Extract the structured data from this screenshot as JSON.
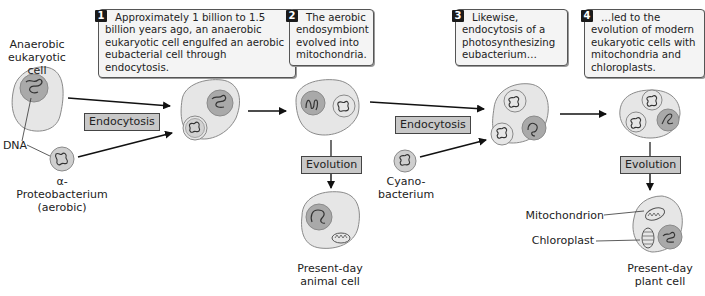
{
  "steps": [
    {
      "number": "1",
      "text": "Approximately 1 billion to 1.5 billion years ago, an anaerobic eukaryotic cell engulfed an aerobic eubacterial cell through endocytosis."
    },
    {
      "number": "2",
      "text": "The aerobic endosymbiont evolved into mitochondria."
    },
    {
      "number": "3",
      "text": "Likewise, endocytosis of a photosynthesizing eubacterium…"
    },
    {
      "number": "4",
      "text": "…led to the evolution of modern eukaryotic cells with mitochondria and chloroplasts."
    }
  ],
  "labels": {
    "anaerobic_cell": "Anaerobic eukaryotic cell",
    "dna": "DNA",
    "proteobacterium": "α-Proteobacterium (aerobic)",
    "cyanobacterium": "Cyano- bacterium",
    "animal_cell": "Present-day animal cell",
    "plant_cell": "Present-day plant cell",
    "mitochondrion": "Mitochondrion",
    "chloroplast": "Chloroplast"
  },
  "processes": {
    "endocytosis_1": "Endocytosis",
    "endocytosis_2": "Endocytosis",
    "evolution_1": "Evolution",
    "evolution_2": "Evolution"
  },
  "colors": {
    "cell_fill": "#e6e6e6",
    "cell_stroke": "#8a8a8a",
    "nucleus_fill": "#a9a9a9",
    "box_fill": "#c8c8c8",
    "callout_fill": "#f4f4f4"
  }
}
